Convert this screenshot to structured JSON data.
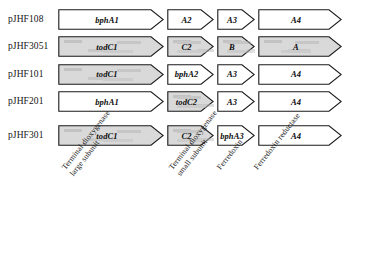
{
  "figure": {
    "type": "gene-cluster-diagram",
    "background": "#ffffff",
    "outline_color": "#1a1a1a",
    "shaded_fill": "#d9d9d9",
    "white_fill": "#ffffff"
  },
  "rows": [
    {
      "plasmid": "pJHF108",
      "genes": [
        {
          "label": "bphA1",
          "shaded": false,
          "width": 106
        },
        {
          "label": "A2",
          "shaded": false,
          "width": 47
        },
        {
          "label": "A3",
          "shaded": false,
          "width": 38
        },
        {
          "label": "A4",
          "shaded": false,
          "width": 84
        }
      ]
    },
    {
      "plasmid": "pJHF3051",
      "genes": [
        {
          "label": "todC1",
          "shaded": true,
          "width": 106
        },
        {
          "label": "C2",
          "shaded": true,
          "width": 47
        },
        {
          "label": "B",
          "shaded": true,
          "width": 38
        },
        {
          "label": "A",
          "shaded": true,
          "width": 84
        }
      ]
    },
    {
      "plasmid": "pJHF101",
      "genes": [
        {
          "label": "todC1",
          "shaded": true,
          "width": 106
        },
        {
          "label": "bphA2",
          "shaded": false,
          "width": 47
        },
        {
          "label": "A3",
          "shaded": false,
          "width": 38
        },
        {
          "label": "A4",
          "shaded": false,
          "width": 84
        }
      ]
    },
    {
      "plasmid": "pJHF201",
      "genes": [
        {
          "label": "bphA1",
          "shaded": false,
          "width": 106
        },
        {
          "label": "todC2",
          "shaded": true,
          "width": 47
        },
        {
          "label": "A3",
          "shaded": false,
          "width": 38
        },
        {
          "label": "A4",
          "shaded": false,
          "width": 84
        }
      ]
    },
    {
      "plasmid": "pJHF301",
      "genes": [
        {
          "label": "todC1",
          "shaded": true,
          "width": 106
        },
        {
          "label": "C2",
          "shaded": true,
          "width": 47
        },
        {
          "label": "bphA3",
          "shaded": false,
          "width": 38
        },
        {
          "label": "A4",
          "shaded": false,
          "width": 84
        }
      ]
    }
  ],
  "function_labels": [
    {
      "lines": [
        "Terminal dioxygenase",
        "large subunit"
      ],
      "x": 60,
      "y": 166
    },
    {
      "lines": [
        "Terminal dioxygenase",
        "small subunit"
      ],
      "x": 167,
      "y": 166
    },
    {
      "lines": [
        "Ferredoxin"
      ],
      "x": 215,
      "y": 166
    },
    {
      "lines": [
        "Ferredoxin reductase"
      ],
      "x": 252,
      "y": 166
    }
  ]
}
